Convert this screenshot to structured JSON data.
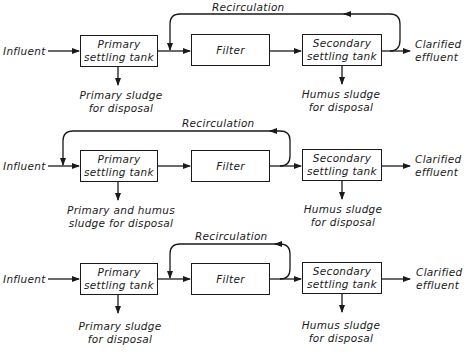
{
  "diagrams": [
    {
      "variant": "recirculation from secondary effluent to filter inlet",
      "influent": "Influent",
      "primary": [
        "Primary",
        "settling tank"
      ],
      "filter": "Filter",
      "secondary": [
        "Secondary",
        "settling tank"
      ],
      "effluent": [
        "Clarified",
        "effluent"
      ],
      "recirculation": "Recirculation",
      "primary_out": [
        "Primary sludge",
        "for disposal"
      ],
      "secondary_out": [
        "Humus sludge",
        "for disposal"
      ]
    },
    {
      "variant": "recirculation from filter effluent to primary inlet",
      "influent": "Influent",
      "primary": [
        "Primary",
        "settling tank"
      ],
      "filter": "Filter",
      "secondary": [
        "Secondary",
        "settling tank"
      ],
      "effluent": [
        "Clarified",
        "effluent"
      ],
      "recirculation": "Recirculation",
      "primary_out": [
        "Primary and humus",
        "sludge for disposal"
      ],
      "secondary_out": [
        "Humus sludge",
        "for disposal"
      ]
    },
    {
      "variant": "recirculation from filter effluent to filter inlet",
      "influent": "Influent",
      "primary": [
        "Primary",
        "settling tank"
      ],
      "filter": "Filter",
      "secondary": [
        "Secondary",
        "settling tank"
      ],
      "effluent": [
        "Clarified",
        "effluent"
      ],
      "recirculation": "Recirculation",
      "primary_out": [
        "Primary sludge",
        "for disposal"
      ],
      "secondary_out": [
        "Humus sludge",
        "for disposal"
      ]
    }
  ],
  "colors": {
    "line": "#1a1a1a",
    "background": "#ffffff"
  }
}
